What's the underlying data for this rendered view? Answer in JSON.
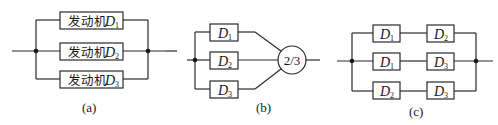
{
  "diagram_a": {
    "label": "(a)",
    "blocks": [
      {
        "prefix": "发动机",
        "name": "D",
        "sub": "1"
      },
      {
        "prefix": "发动机",
        "name": "D",
        "sub": "2"
      },
      {
        "prefix": "发动机",
        "name": "D",
        "sub": "3"
      }
    ]
  },
  "diagram_b": {
    "label": "(b)",
    "blocks": [
      {
        "name": "D",
        "sub": "1"
      },
      {
        "name": "D",
        "sub": "2"
      },
      {
        "name": "D",
        "sub": "3"
      }
    ],
    "voter": "2/3"
  },
  "diagram_c": {
    "label": "(c)",
    "rows": [
      [
        {
          "name": "D",
          "sub": "1"
        },
        {
          "name": "D",
          "sub": "2"
        }
      ],
      [
        {
          "name": "D",
          "sub": "1"
        },
        {
          "name": "D",
          "sub": "3"
        }
      ],
      [
        {
          "name": "D",
          "sub": "2"
        },
        {
          "name": "D",
          "sub": "3"
        }
      ]
    ]
  }
}
